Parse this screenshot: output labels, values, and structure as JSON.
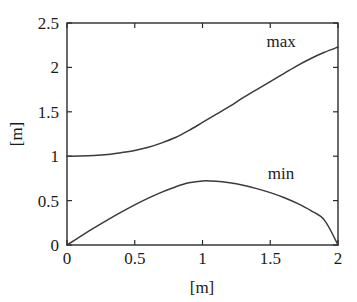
{
  "chart_data": {
    "type": "line",
    "title": "",
    "xlabel": "[m]",
    "ylabel": "[m]",
    "xlim": [
      0,
      2
    ],
    "ylim": [
      0,
      2.5
    ],
    "grid": false,
    "legend_position": "inline-annotation",
    "xticks": [
      "0",
      "0.5",
      "1",
      "1.5",
      "2"
    ],
    "xtick_values": [
      0,
      0.5,
      1,
      1.5,
      2
    ],
    "yticks": [
      "0",
      "0.5",
      "1",
      "1.5",
      "2",
      "2.5"
    ],
    "ytick_values": [
      0,
      0.5,
      1,
      1.5,
      2,
      2.5
    ],
    "x": [
      0,
      0.1,
      0.2,
      0.3,
      0.4,
      0.5,
      0.6,
      0.7,
      0.8,
      0.9,
      1.0,
      1.1,
      1.2,
      1.3,
      1.4,
      1.5,
      1.6,
      1.7,
      1.8,
      1.9,
      2.0
    ],
    "series": [
      {
        "name": "max",
        "label": "max",
        "label_x": 1.58,
        "label_y": 2.23,
        "values": [
          1.0,
          1.002,
          1.008,
          1.02,
          1.04,
          1.065,
          1.1,
          1.15,
          1.21,
          1.29,
          1.38,
          1.47,
          1.56,
          1.66,
          1.75,
          1.84,
          1.93,
          2.02,
          2.1,
          2.17,
          2.23
        ]
      },
      {
        "name": "min",
        "label": "min",
        "label_x": 1.58,
        "label_y": 0.74,
        "values": [
          0.0,
          0.097,
          0.192,
          0.283,
          0.37,
          0.452,
          0.528,
          0.596,
          0.654,
          0.7,
          0.722,
          0.718,
          0.7,
          0.672,
          0.635,
          0.59,
          0.535,
          0.468,
          0.387,
          0.28,
          0.0
        ]
      }
    ]
  },
  "axis_labels": {
    "x_axis_title": "[m]",
    "y_axis_title": "[m]"
  }
}
